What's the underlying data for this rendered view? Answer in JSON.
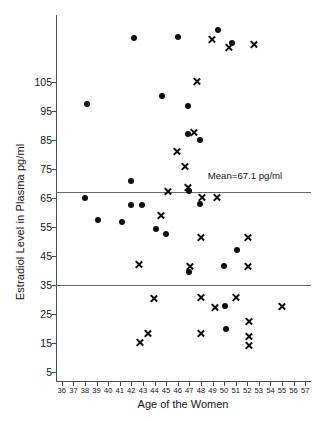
{
  "chart_data": {
    "type": "scatter",
    "title": "",
    "xlabel": "Age of the Women",
    "ylabel": "Estradiol Level in Plasma pg/ml",
    "xlim": [
      35.5,
      57.5
    ],
    "ylim": [
      2,
      128
    ],
    "grid": false,
    "legend": "none",
    "xticks": [
      36,
      37,
      38,
      39,
      40,
      41,
      42,
      43,
      44,
      45,
      46,
      47,
      48,
      49,
      50,
      51,
      52,
      53,
      54,
      55,
      56,
      57
    ],
    "yticks": [
      5,
      15,
      25,
      35,
      45,
      55,
      65,
      75,
      85,
      95,
      105
    ],
    "ytick_labels": [
      "5",
      "15",
      "25",
      "35",
      "45",
      "55",
      "65",
      "75",
      "85",
      "95",
      "105"
    ],
    "reference_lines": [
      {
        "name": "mean-line",
        "y": 67.1,
        "label": "Mean=67.1 pg/ml",
        "label_x": 48.6,
        "label_y": 72.5
      },
      {
        "name": "lower-line",
        "y": 35.0,
        "label": "",
        "label_x": 0,
        "label_y": 0
      }
    ],
    "series": [
      {
        "name": "filled-circle",
        "marker": "circle",
        "color": "#0d0d0d",
        "points": [
          {
            "x": 38.0,
            "y": 65.0
          },
          {
            "x": 38.2,
            "y": 97.5
          },
          {
            "x": 39.1,
            "y": 57.5
          },
          {
            "x": 41.2,
            "y": 56.8
          },
          {
            "x": 42.0,
            "y": 71.0
          },
          {
            "x": 42.0,
            "y": 62.5
          },
          {
            "x": 42.2,
            "y": 120.0
          },
          {
            "x": 42.9,
            "y": 62.5
          },
          {
            "x": 44.1,
            "y": 54.5
          },
          {
            "x": 44.6,
            "y": 100.0
          },
          {
            "x": 45.0,
            "y": 52.5
          },
          {
            "x": 46.0,
            "y": 120.3
          },
          {
            "x": 46.9,
            "y": 96.8
          },
          {
            "x": 46.9,
            "y": 87.0
          },
          {
            "x": 47.0,
            "y": 67.3
          },
          {
            "x": 47.0,
            "y": 39.5
          },
          {
            "x": 47.9,
            "y": 85.0
          },
          {
            "x": 47.9,
            "y": 63.0
          },
          {
            "x": 49.5,
            "y": 123.0
          },
          {
            "x": 50.0,
            "y": 41.5
          },
          {
            "x": 50.1,
            "y": 28.0
          },
          {
            "x": 50.2,
            "y": 20.0
          },
          {
            "x": 50.7,
            "y": 118.5
          },
          {
            "x": 51.1,
            "y": 47.0
          }
        ]
      },
      {
        "name": "cross",
        "marker": "x",
        "color": "#0d0d0d",
        "points": [
          {
            "x": 42.6,
            "y": 42.0
          },
          {
            "x": 42.7,
            "y": 15.2
          },
          {
            "x": 43.4,
            "y": 18.5
          },
          {
            "x": 43.9,
            "y": 30.5
          },
          {
            "x": 44.5,
            "y": 59.0
          },
          {
            "x": 45.1,
            "y": 67.4
          },
          {
            "x": 45.9,
            "y": 81.0
          },
          {
            "x": 46.6,
            "y": 76.0
          },
          {
            "x": 46.9,
            "y": 68.5
          },
          {
            "x": 47.0,
            "y": 41.5
          },
          {
            "x": 47.4,
            "y": 87.5
          },
          {
            "x": 47.6,
            "y": 105.0
          },
          {
            "x": 48.0,
            "y": 51.5
          },
          {
            "x": 48.0,
            "y": 30.8
          },
          {
            "x": 48.0,
            "y": 18.5
          },
          {
            "x": 48.1,
            "y": 65.2
          },
          {
            "x": 48.9,
            "y": 119.5
          },
          {
            "x": 49.2,
            "y": 27.2
          },
          {
            "x": 49.4,
            "y": 65.2
          },
          {
            "x": 50.4,
            "y": 117.0
          },
          {
            "x": 51.0,
            "y": 30.7
          },
          {
            "x": 52.0,
            "y": 51.5
          },
          {
            "x": 52.0,
            "y": 41.3
          },
          {
            "x": 52.1,
            "y": 22.5
          },
          {
            "x": 52.1,
            "y": 17.2
          },
          {
            "x": 52.1,
            "y": 14.2
          },
          {
            "x": 52.6,
            "y": 118.0
          },
          {
            "x": 55.0,
            "y": 27.8
          }
        ]
      }
    ]
  }
}
